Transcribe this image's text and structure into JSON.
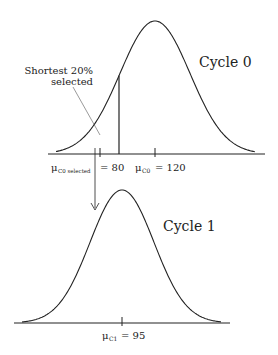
{
  "diagram": {
    "cycle0": {
      "title": "Cycle 0",
      "mean_value": 120,
      "cutoff_value": 80,
      "annotation_line1": "Shortest 20%",
      "annotation_line2": "selected",
      "mu_symbol": "μ",
      "mean_subscript": "C0",
      "mean_equals": "= 120",
      "selected_subscript": "C0 selected",
      "selected_equals": "= 80"
    },
    "cycle1": {
      "title": "Cycle 1",
      "mean_value": 95,
      "mu_symbol": "μ",
      "mean_subscript": "C1",
      "mean_equals": "= 95"
    },
    "selected_fraction": 0.2,
    "line_color": "#222222"
  }
}
